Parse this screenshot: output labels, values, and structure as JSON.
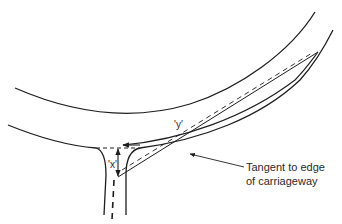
{
  "diagram": {
    "type": "road-junction-visibility",
    "labels": {
      "x_dim": "'x'",
      "y_dim": "'y'",
      "tangent_line1": "Tangent to edge",
      "tangent_line2": "of carriageway"
    },
    "colors": {
      "line": "#1e1e1e",
      "background": "#ffffff"
    }
  }
}
